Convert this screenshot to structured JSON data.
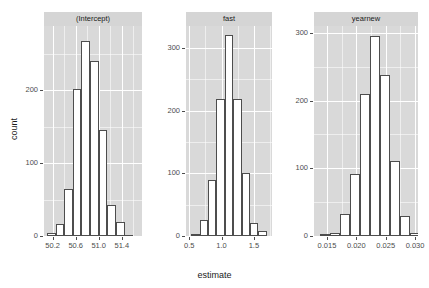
{
  "chart_data": {
    "type": "bar",
    "chart_kind": "faceted-histogram",
    "title": "",
    "xlabel": "estimate",
    "ylabel": "count",
    "grid": true,
    "legend": false,
    "panel_background": "#d9d9d9",
    "gridline_color": "#ffffff",
    "bar_fill": "#ffffff",
    "bar_outline": "#4d4d4d",
    "strip_background": "#d5d5d5",
    "facets": [
      {
        "label": "(Intercept)",
        "xlabel": "estimate",
        "ylabel": "count",
        "xlim": [
          50.05,
          51.75
        ],
        "ylim": [
          0,
          288
        ],
        "xticks": [
          "50.2",
          "50.6",
          "51.0",
          "51.4"
        ],
        "xtick_values": [
          50.2,
          50.6,
          51.0,
          51.4
        ],
        "xminor_values": [
          50.4,
          50.8,
          51.2,
          51.6
        ],
        "yticks": [
          "0",
          "100",
          "200"
        ],
        "ytick_values": [
          0,
          100,
          200
        ],
        "yminor_values": [
          50,
          150,
          250
        ],
        "bin_width": 0.15,
        "bin_starts": [
          50.1,
          50.25,
          50.4,
          50.55,
          50.7,
          50.85,
          51.0,
          51.15,
          51.3,
          51.45
        ],
        "values": [
          4,
          17,
          65,
          202,
          268,
          240,
          145,
          43,
          19,
          2
        ]
      },
      {
        "label": "fast",
        "xlabel": "estimate",
        "ylabel": "count",
        "xlim": [
          0.45,
          1.78
        ],
        "ylim": [
          0,
          335
        ],
        "xticks": [
          "0.5",
          "1.0",
          "1.5"
        ],
        "xtick_values": [
          0.5,
          1.0,
          1.5
        ],
        "xminor_values": [
          0.75,
          1.25,
          1.75
        ],
        "yticks": [
          "0",
          "100",
          "200",
          "300"
        ],
        "ytick_values": [
          0,
          100,
          200,
          300
        ],
        "yminor_values": [
          50,
          150,
          250
        ],
        "bin_width": 0.13,
        "bin_starts": [
          0.53,
          0.66,
          0.79,
          0.92,
          1.05,
          1.18,
          1.31,
          1.44,
          1.57
        ],
        "values": [
          3,
          25,
          90,
          218,
          320,
          218,
          100,
          20,
          8
        ]
      },
      {
        "label": "yearnew",
        "xlabel": "estimate",
        "ylabel": "count",
        "xlim": [
          0.0128,
          0.0305
        ],
        "ylim": [
          0,
          310
        ],
        "xticks": [
          "0.015",
          "0.020",
          "0.025",
          "0.030"
        ],
        "xtick_values": [
          0.015,
          0.02,
          0.025,
          0.03
        ],
        "xminor_values": [
          0.0175,
          0.0225,
          0.0275
        ],
        "yticks": [
          "0",
          "100",
          "200",
          "300"
        ],
        "ytick_values": [
          0,
          100,
          200,
          300
        ],
        "yminor_values": [
          50,
          150,
          250
        ],
        "bin_width": 0.0017,
        "bin_starts": [
          0.0138,
          0.0155,
          0.0172,
          0.0189,
          0.0206,
          0.0223,
          0.024,
          0.0257,
          0.0274,
          0.0291
        ],
        "values": [
          3,
          4,
          33,
          92,
          210,
          295,
          237,
          110,
          29,
          5
        ]
      }
    ]
  }
}
